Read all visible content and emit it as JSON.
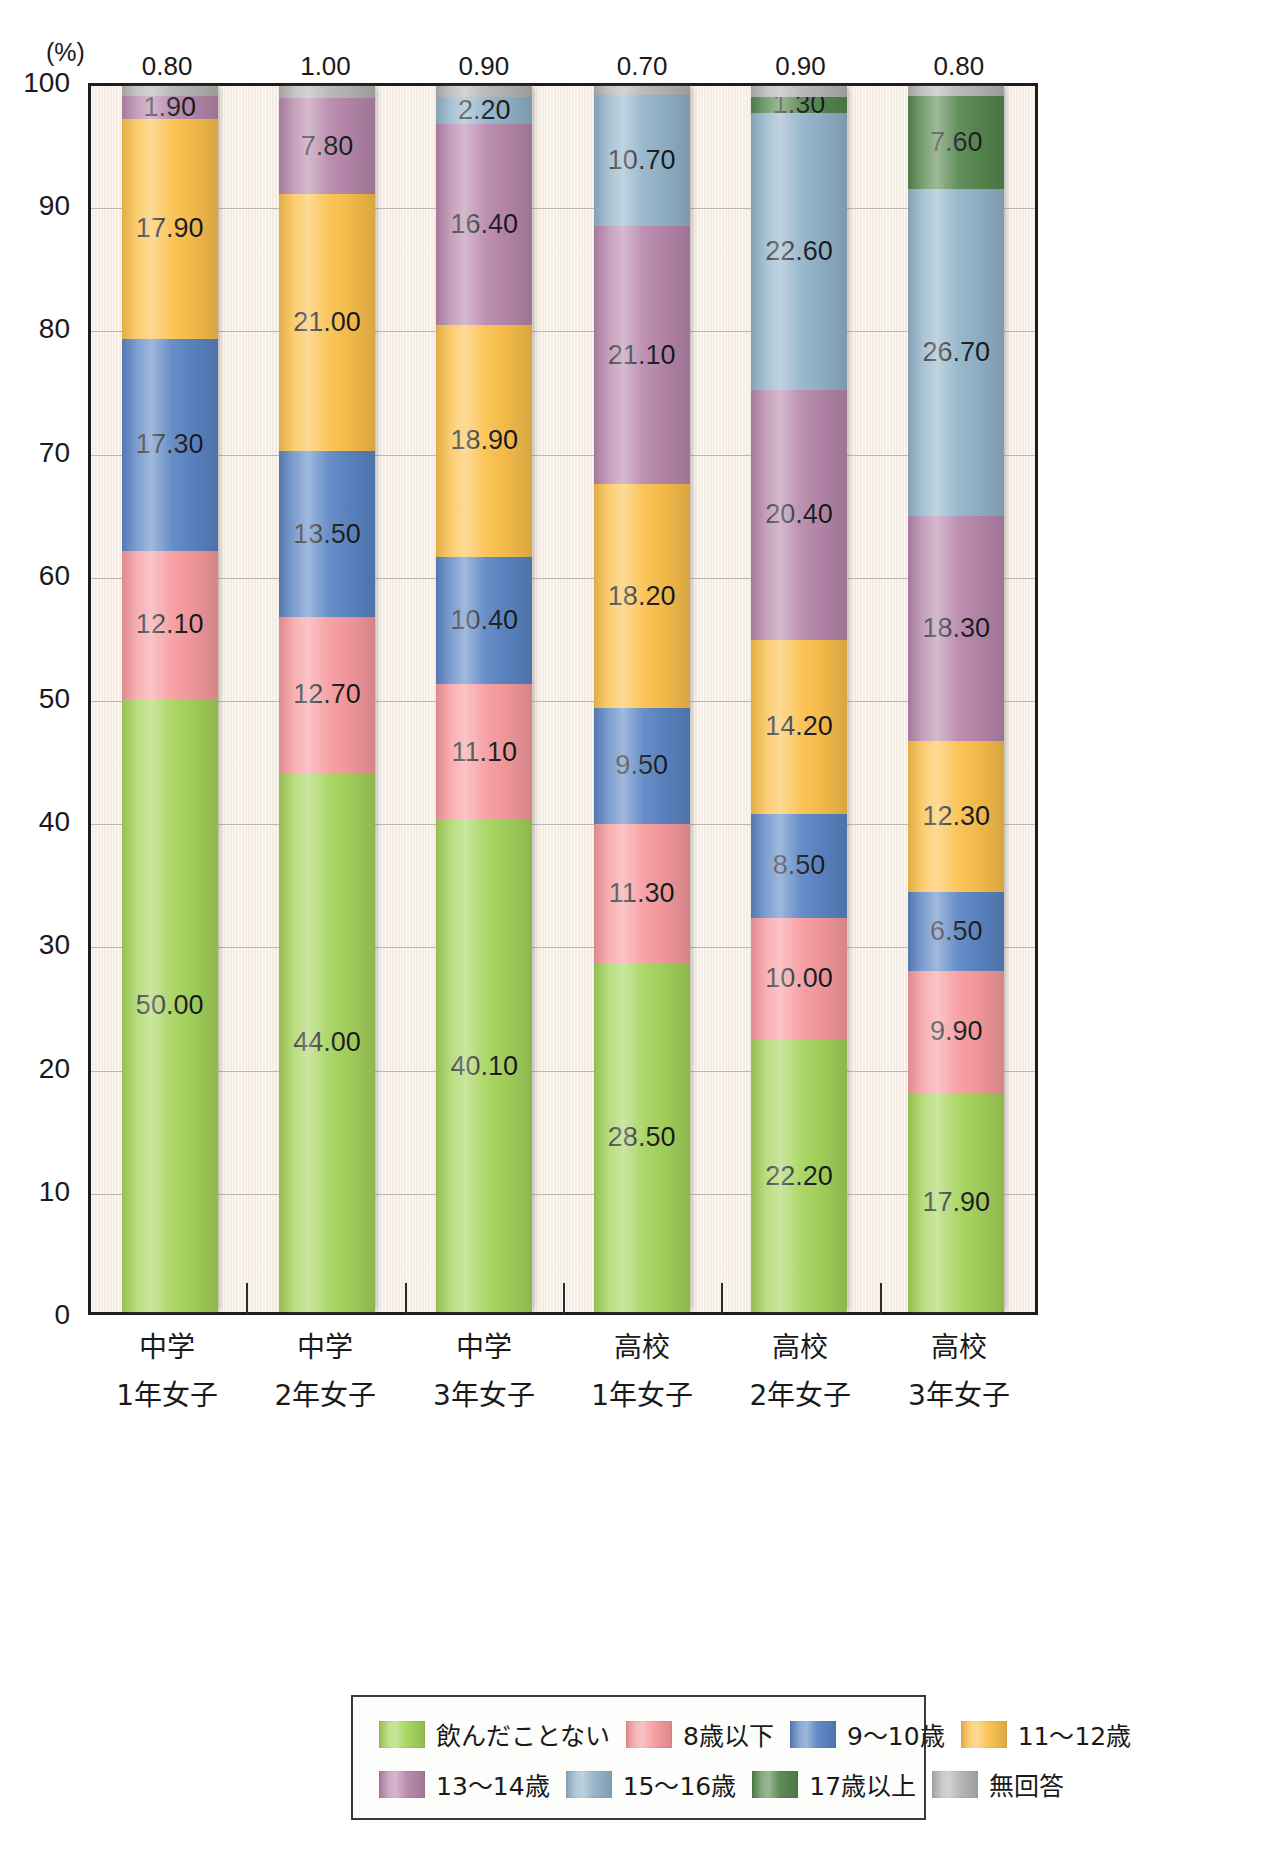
{
  "chart_data": {
    "type": "bar",
    "stacked": true,
    "title": "",
    "subtitle": "",
    "xlabel": "",
    "ylabel": "(%)",
    "unit_label": "(%)",
    "ylim": [
      0,
      100
    ],
    "ytick_labels": [
      "0",
      "10",
      "20",
      "30",
      "40",
      "50",
      "60",
      "70",
      "80",
      "90",
      "100"
    ],
    "ytick_values": [
      0,
      10,
      20,
      30,
      40,
      50,
      60,
      70,
      80,
      90,
      100
    ],
    "grid": true,
    "legend_position": "bottom",
    "categories": [
      "中学1年女子",
      "中学2年女子",
      "中学3年女子",
      "高校1年女子",
      "高校2年女子",
      "高校3年女子"
    ],
    "category_lines": [
      [
        "中学",
        "1年女子"
      ],
      [
        "中学",
        "2年女子"
      ],
      [
        "中学",
        "3年女子"
      ],
      [
        "高校",
        "1年女子"
      ],
      [
        "高校",
        "2年女子"
      ],
      [
        "高校",
        "3年女子"
      ]
    ],
    "series": [
      {
        "name": "飲んだことない",
        "color": "#a5d champs",
        "values": [
          50.0,
          44.0,
          40.1,
          28.5,
          22.2,
          17.9
        ]
      },
      {
        "name": "8歳以下",
        "color": "#f79a9e",
        "values": [
          12.1,
          12.7,
          11.1,
          11.3,
          10.0,
          9.9
        ]
      },
      {
        "name": "9〜10歳",
        "color": "#5b85c4",
        "values": [
          17.3,
          13.5,
          10.4,
          9.5,
          8.5,
          6.5
        ]
      },
      {
        "name": "11〜12歳",
        "color": "#fbc04b",
        "values": [
          17.9,
          21.0,
          18.9,
          18.2,
          14.2,
          12.3
        ]
      },
      {
        "name": "13〜14歳",
        "color": "#b787ab",
        "values": [
          1.9,
          7.8,
          16.4,
          21.1,
          20.4,
          18.3
        ]
      },
      {
        "name": "15〜16歳",
        "color": "#92b3c9",
        "values": [
          0.0,
          0.0,
          2.2,
          10.7,
          22.6,
          26.7
        ]
      },
      {
        "name": "17歳以上",
        "color": "#56874f",
        "values": [
          0.0,
          0.0,
          0.0,
          0.0,
          1.3,
          7.6
        ]
      },
      {
        "name": "無回答",
        "color": "#b4b4b4",
        "values": [
          0.8,
          1.0,
          0.9,
          0.7,
          0.9,
          0.8
        ]
      }
    ],
    "top_labels": [
      "0.80",
      "1.00",
      "0.90",
      "0.70",
      "0.90",
      "0.80"
    ],
    "bar_value_labels": [
      [
        "50.00",
        "12.10",
        "17.30",
        "17.90",
        "1.90",
        "",
        "",
        ""
      ],
      [
        "44.00",
        "12.70",
        "13.50",
        "21.00",
        "7.80",
        "",
        "",
        ""
      ],
      [
        "40.10",
        "11.10",
        "10.40",
        "18.90",
        "16.40",
        "2.20",
        "",
        ""
      ],
      [
        "28.50",
        "11.30",
        "9.50",
        "18.20",
        "21.10",
        "10.70",
        "",
        ""
      ],
      [
        "22.20",
        "10.00",
        "8.50",
        "14.20",
        "20.40",
        "22.60",
        "1.30",
        ""
      ],
      [
        "17.90",
        "9.90",
        "6.50",
        "12.30",
        "18.30",
        "26.70",
        "7.60",
        ""
      ]
    ]
  },
  "colors": {
    "none": "#a5d45c",
    "age_8_under": "#f79a9e",
    "age_9_10": "#5b85c4",
    "age_11_12": "#fbc04b",
    "age_13_14": "#b787ab",
    "age_15_16": "#92b3c9",
    "age_17_over": "#56874f",
    "no_answer": "#b4b4b4",
    "plot_bg": "#f8f1ea",
    "axis": "#1d1d1d",
    "grid": "#a9a29c"
  },
  "legend": {
    "rows": [
      [
        {
          "label": "飲んだことない",
          "color_key": "none"
        },
        {
          "label": "8歳以下",
          "color_key": "age_8_under"
        },
        {
          "label": "9〜10歳",
          "color_key": "age_9_10"
        },
        {
          "label": "11〜12歳",
          "color_key": "age_11_12"
        }
      ],
      [
        {
          "label": "13〜14歳",
          "color_key": "age_13_14"
        },
        {
          "label": "15〜16歳",
          "color_key": "age_15_16"
        },
        {
          "label": "17歳以上",
          "color_key": "age_17_over"
        },
        {
          "label": "無回答",
          "color_key": "no_answer"
        }
      ]
    ]
  }
}
